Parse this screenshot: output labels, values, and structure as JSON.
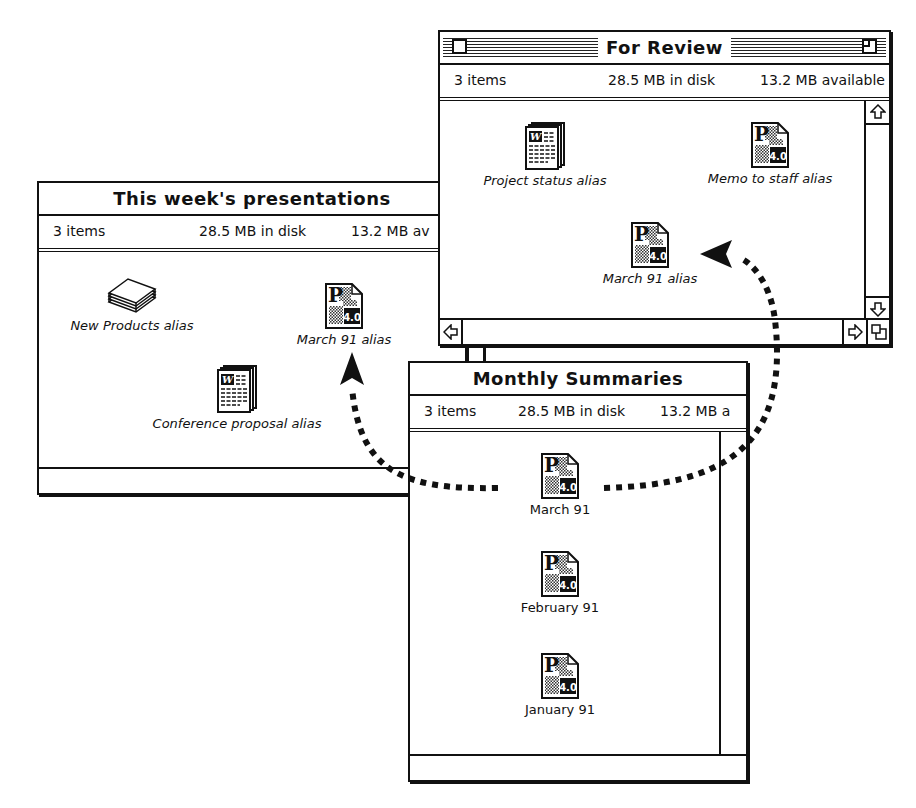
{
  "windows": {
    "presentations": {
      "title": "This week's presentations",
      "info": {
        "items": "3 items",
        "disk": "28.5 MB in disk",
        "available": "13.2 MB av"
      },
      "icons": [
        {
          "label": "New Products alias",
          "type": "stack-icon",
          "alias": true
        },
        {
          "label": "March 91 alias",
          "type": "persuasion-doc-icon",
          "alias": true
        },
        {
          "label": "Conference proposal alias",
          "type": "word-doc-icon",
          "alias": true
        }
      ]
    },
    "review": {
      "title": "For Review",
      "info": {
        "items": "3 items",
        "disk": "28.5 MB in disk",
        "available": "13.2 MB available"
      },
      "icons": [
        {
          "label": "Project status alias",
          "type": "word-doc-icon",
          "alias": true
        },
        {
          "label": "Memo to staff alias",
          "type": "persuasion-doc-icon",
          "alias": true
        },
        {
          "label": "March 91 alias",
          "type": "persuasion-doc-icon",
          "alias": true
        }
      ]
    },
    "monthly": {
      "title": "Monthly Summaries",
      "info": {
        "items": "3 items",
        "disk": "28.5 MB in disk",
        "available": "13.2 MB a"
      },
      "icons": [
        {
          "label": "March 91",
          "type": "persuasion-doc-icon",
          "alias": false
        },
        {
          "label": "February 91",
          "type": "persuasion-doc-icon",
          "alias": false
        },
        {
          "label": "January 91",
          "type": "persuasion-doc-icon",
          "alias": false
        }
      ]
    }
  },
  "icon_text": {
    "word_glyph": "W",
    "persuasion_letter": "P",
    "persuasion_version": "4.0"
  }
}
